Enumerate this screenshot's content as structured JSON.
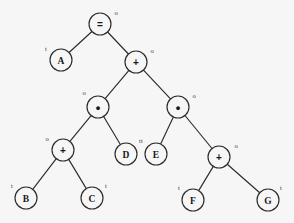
{
  "diagram": {
    "background_color": "#f7f6f7",
    "stroke_color": "#2b2b2b",
    "text_color": "#181818",
    "node_radius": 11,
    "tag_legend": {
      "o": "operator / non-terminal node",
      "t": "terminal / leaf node"
    },
    "nodes": [
      {
        "id": "n0",
        "label": "=",
        "tag": "o",
        "x": 100,
        "y": 24,
        "tag_x": 116,
        "tag_y": 12,
        "kind": "operator",
        "glyph": "equals"
      },
      {
        "id": "n1",
        "label": "A",
        "tag": "t",
        "x": 61,
        "y": 60,
        "tag_x": 46,
        "tag_y": 48,
        "kind": "terminal",
        "glyph": "letter"
      },
      {
        "id": "n2",
        "label": "+",
        "tag": "o",
        "x": 136,
        "y": 62,
        "tag_x": 152,
        "tag_y": 50,
        "kind": "operator",
        "glyph": "plus"
      },
      {
        "id": "n3",
        "label": "•",
        "tag": "o",
        "x": 98,
        "y": 107,
        "tag_x": 84,
        "tag_y": 92,
        "kind": "operator",
        "glyph": "times"
      },
      {
        "id": "n4",
        "label": "•",
        "tag": "o",
        "x": 178,
        "y": 107,
        "tag_x": 194,
        "tag_y": 95,
        "kind": "operator",
        "glyph": "times"
      },
      {
        "id": "n5",
        "label": "+",
        "tag": "o",
        "x": 63,
        "y": 150,
        "tag_x": 47,
        "tag_y": 138,
        "kind": "operator",
        "glyph": "plus"
      },
      {
        "id": "n6",
        "label": "D",
        "tag": "t",
        "x": 126,
        "y": 154,
        "tag_x": 140,
        "tag_y": 140,
        "kind": "terminal",
        "glyph": "letter"
      },
      {
        "id": "n7",
        "label": "E",
        "tag": "t",
        "x": 156,
        "y": 154,
        "tag_x": 142,
        "tag_y": 140,
        "kind": "terminal",
        "glyph": "letter"
      },
      {
        "id": "n8",
        "label": "+",
        "tag": "o",
        "x": 219,
        "y": 157,
        "tag_x": 236,
        "tag_y": 145,
        "kind": "operator",
        "glyph": "plus"
      },
      {
        "id": "n9",
        "label": "B",
        "tag": "t",
        "x": 26,
        "y": 198,
        "tag_x": 12,
        "tag_y": 185,
        "kind": "terminal",
        "glyph": "letter"
      },
      {
        "id": "n10",
        "label": "C",
        "tag": "t",
        "x": 92,
        "y": 198,
        "tag_x": 106,
        "tag_y": 185,
        "kind": "terminal",
        "glyph": "letter"
      },
      {
        "id": "n11",
        "label": "F",
        "tag": "t",
        "x": 193,
        "y": 200,
        "tag_x": 179,
        "tag_y": 187,
        "kind": "terminal",
        "glyph": "letter"
      },
      {
        "id": "n12",
        "label": "G",
        "tag": "t",
        "x": 268,
        "y": 200,
        "tag_x": 281,
        "tag_y": 187,
        "kind": "terminal",
        "glyph": "letter"
      }
    ],
    "edges": [
      {
        "id": "e0",
        "from": "n0",
        "to": "n1"
      },
      {
        "id": "e1",
        "from": "n0",
        "to": "n2"
      },
      {
        "id": "e2",
        "from": "n2",
        "to": "n3"
      },
      {
        "id": "e3",
        "from": "n2",
        "to": "n4"
      },
      {
        "id": "e4",
        "from": "n3",
        "to": "n5"
      },
      {
        "id": "e5",
        "from": "n3",
        "to": "n6"
      },
      {
        "id": "e6",
        "from": "n4",
        "to": "n7"
      },
      {
        "id": "e7",
        "from": "n4",
        "to": "n8"
      },
      {
        "id": "e8",
        "from": "n5",
        "to": "n9"
      },
      {
        "id": "e9",
        "from": "n5",
        "to": "n10"
      },
      {
        "id": "e10",
        "from": "n8",
        "to": "n11"
      },
      {
        "id": "e11",
        "from": "n8",
        "to": "n12"
      }
    ]
  }
}
